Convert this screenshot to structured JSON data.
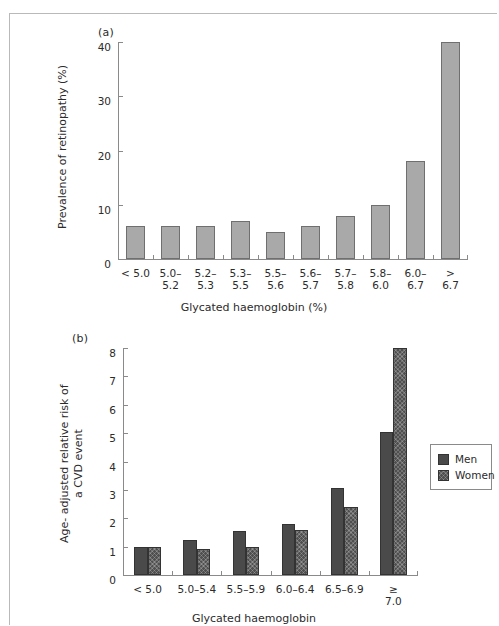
{
  "figure": {
    "panel_a_letter": "(a)",
    "panel_b_letter": "(b)"
  },
  "chart_data": [
    {
      "panel": "(a)",
      "type": "bar",
      "title": "",
      "xlabel": "Glycated haemoglobin (%)",
      "ylabel": "Prevalence of retinopathy (%)",
      "categories": [
        "< 5.0",
        "5.0–\n5.2",
        "5.2–\n5.3",
        "5.3–\n5.5",
        "5.5–\n5.6",
        "5.6–\n5.7",
        "5.7–\n5.8",
        "5.8–\n6.0",
        "6.0–\n6.7",
        "> 6.7"
      ],
      "values": [
        6,
        6,
        6,
        7,
        5,
        6,
        8,
        10,
        18,
        40
      ],
      "ylim": [
        0,
        40
      ],
      "yticks": [
        0,
        10,
        20,
        30,
        40
      ],
      "ytick_labels": [
        "0",
        "10",
        "20",
        "30",
        "40"
      ],
      "grid": false,
      "legend": null,
      "bar_color": "#a9a9a9",
      "bar_edge_color": "#6f6f6f"
    },
    {
      "panel": "(b)",
      "type": "bar",
      "title": "",
      "xlabel": "Glycated haemoglobin",
      "ylabel": "Age- adjusted relative risk of\na CVD event",
      "categories": [
        "< 5.0",
        "5.0–5.4",
        "5.5–5.9",
        "6.0–6.4",
        "6.5–6.9",
        "≥ 7.0"
      ],
      "series": [
        {
          "name": "Men",
          "values": [
            1.0,
            1.25,
            1.55,
            1.8,
            3.05,
            5.05
          ],
          "color": "#4a4a4a"
        },
        {
          "name": "Women",
          "values": [
            1.0,
            0.9,
            1.0,
            1.6,
            2.4,
            8.0
          ],
          "color": "#4f4f4f"
        }
      ],
      "ylim": [
        0,
        8
      ],
      "yticks": [
        0,
        1,
        2,
        3,
        4,
        5,
        6,
        7,
        8
      ],
      "ytick_labels": [
        "0",
        "1",
        "2",
        "3",
        "4",
        "5",
        "6",
        "7",
        "8"
      ],
      "grid": false,
      "legend_position": "right",
      "legend_entries": [
        "Men",
        "Women"
      ]
    }
  ]
}
